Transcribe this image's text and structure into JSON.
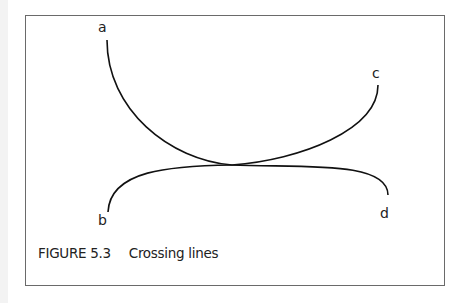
{
  "figure": {
    "caption_number": "FIGURE 5.3",
    "caption_text": "Crossing lines"
  },
  "points": {
    "a": "a",
    "b": "b",
    "c": "c",
    "d": "d"
  },
  "colors": {
    "line": "#111111",
    "frame": "#6a6a6a",
    "text": "#222222"
  }
}
